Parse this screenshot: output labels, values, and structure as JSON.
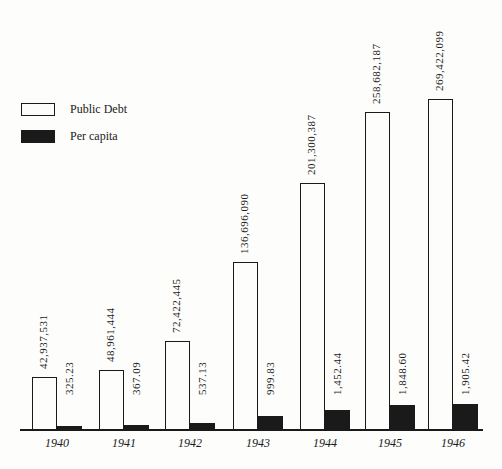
{
  "chart_data": {
    "type": "bar",
    "title": "",
    "xlabel": "",
    "ylabel": "",
    "grid": false,
    "legend_position": "top-left",
    "categories": [
      "1940",
      "1941",
      "1942",
      "1943",
      "1944",
      "1945",
      "1946"
    ],
    "series": [
      {
        "name": "Public Debt",
        "style": "white-outlined",
        "values": [
          42937531,
          48961444,
          72422445,
          136696090,
          201300387,
          258682187,
          269422099
        ],
        "labels": [
          "42,937,531",
          "48,961,444",
          "72,422,445",
          "136,696,090",
          "201,300,387",
          "258,682,187",
          "269,422,099"
        ]
      },
      {
        "name": "Per capita",
        "style": "black-filled",
        "values": [
          325.23,
          367.09,
          537.13,
          999.83,
          1452.44,
          1848.6,
          1905.42
        ],
        "labels": [
          "325.23",
          "367.09",
          "537.13",
          "999.83",
          "1,452.44",
          "1,848.60",
          "1,905.42"
        ]
      }
    ]
  },
  "legend": {
    "debt_label": "Public Debt",
    "capita_label": "Per capita"
  },
  "colors": {
    "background": "#fdfdfc",
    "ink": "#1a1a1a"
  }
}
